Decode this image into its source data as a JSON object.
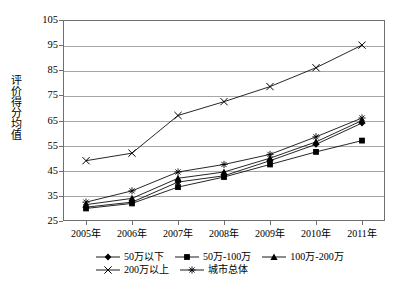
{
  "chart_data": {
    "type": "line",
    "title": "",
    "xlabel": "",
    "ylabel": "评价得分均值",
    "categories": [
      "2005年",
      "2006年",
      "2007年",
      "2008年",
      "2009年",
      "2010年",
      "2011年"
    ],
    "ylim": [
      25,
      105
    ],
    "ytick_step": 10,
    "yticks": [
      "25",
      "35",
      "45",
      "55",
      "65",
      "75",
      "85",
      "95",
      "105"
    ],
    "grid": true,
    "legend_position": "bottom",
    "series": [
      {
        "name": "50万以下",
        "marker": "diamond",
        "values": [
          30.5,
          32.5,
          40.5,
          43.0,
          49.0,
          55.5,
          64.0
        ]
      },
      {
        "name": "50万-100万",
        "marker": "square",
        "values": [
          30.0,
          32.0,
          38.5,
          42.5,
          47.5,
          52.5,
          57.0
        ]
      },
      {
        "name": "100万-200万",
        "marker": "triangle",
        "values": [
          31.5,
          34.0,
          42.0,
          44.5,
          50.0,
          56.5,
          65.0
        ]
      },
      {
        "name": "200万以上",
        "marker": "x",
        "values": [
          49.0,
          52.0,
          67.0,
          72.5,
          78.5,
          86.0,
          95.0
        ]
      },
      {
        "name": "城市总体",
        "marker": "star",
        "values": [
          32.5,
          37.0,
          44.5,
          47.5,
          51.5,
          58.5,
          66.0
        ]
      }
    ]
  },
  "legend": {
    "rows": [
      [
        {
          "label": "50万以下",
          "marker": "diamond"
        },
        {
          "label": "50万-100万",
          "marker": "square"
        },
        {
          "label": "100万-200万",
          "marker": "triangle"
        }
      ],
      [
        {
          "label": "200万以上",
          "marker": "x"
        },
        {
          "label": "城市总体",
          "marker": "star"
        }
      ]
    ]
  }
}
